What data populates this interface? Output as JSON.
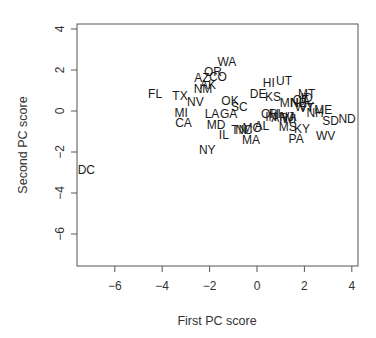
{
  "chart_data": {
    "type": "scatter",
    "title": "",
    "xlabel": "First PC score",
    "ylabel": "Second PC score",
    "xlim": [
      -7.5,
      4.2
    ],
    "ylim": [
      -7.5,
      4.3
    ],
    "x_ticks": [
      -6,
      -4,
      -2,
      0,
      2,
      4
    ],
    "y_ticks": [
      -6,
      -4,
      -2,
      0,
      2,
      4
    ],
    "grid": false,
    "legend": null,
    "marker": "text-label",
    "points": [
      {
        "label": "WA",
        "x": -1.27,
        "y": 2.4
      },
      {
        "label": "OR",
        "x": -1.86,
        "y": 1.9
      },
      {
        "label": "AZ",
        "x": -2.32,
        "y": 1.6
      },
      {
        "label": "CO",
        "x": -1.65,
        "y": 1.65
      },
      {
        "label": "AK",
        "x": -2.07,
        "y": 1.25
      },
      {
        "label": "NM",
        "x": -2.28,
        "y": 1.05
      },
      {
        "label": "FL",
        "x": -4.3,
        "y": 0.85
      },
      {
        "label": "TX",
        "x": -3.25,
        "y": 0.73
      },
      {
        "label": "NV",
        "x": -2.6,
        "y": 0.45
      },
      {
        "label": "MI",
        "x": -3.2,
        "y": -0.1
      },
      {
        "label": "CA",
        "x": -3.1,
        "y": -0.6
      },
      {
        "label": "LA",
        "x": -1.9,
        "y": -0.15
      },
      {
        "label": "GA",
        "x": -1.2,
        "y": -0.15
      },
      {
        "label": "MD",
        "x": -1.73,
        "y": -0.7
      },
      {
        "label": "IL",
        "x": -1.4,
        "y": -1.15
      },
      {
        "label": "NY",
        "x": -2.1,
        "y": -1.9
      },
      {
        "label": "DC",
        "x": -7.2,
        "y": -2.9
      },
      {
        "label": "OK",
        "x": -1.14,
        "y": 0.5
      },
      {
        "label": "SC",
        "x": -0.75,
        "y": 0.2
      },
      {
        "label": "DE",
        "x": 0.05,
        "y": 0.85
      },
      {
        "label": "HI",
        "x": 0.5,
        "y": 1.35
      },
      {
        "label": "UT",
        "x": 1.14,
        "y": 1.45
      },
      {
        "label": "KS",
        "x": 0.68,
        "y": 0.67
      },
      {
        "label": "TN",
        "x": -0.75,
        "y": -0.93
      },
      {
        "label": "NC",
        "x": -0.55,
        "y": -0.93
      },
      {
        "label": "MO",
        "x": -0.2,
        "y": -0.85
      },
      {
        "label": "MA",
        "x": -0.25,
        "y": -1.4
      },
      {
        "label": "AL",
        "x": 0.2,
        "y": -0.72
      },
      {
        "label": "OH",
        "x": 0.55,
        "y": -0.15
      },
      {
        "label": "RI",
        "x": 0.75,
        "y": -0.15
      },
      {
        "label": "IN",
        "x": 0.6,
        "y": -0.3
      },
      {
        "label": "AR",
        "x": 0.95,
        "y": -0.35
      },
      {
        "label": "VA",
        "x": 1.35,
        "y": -0.3
      },
      {
        "label": "WI",
        "x": 1.35,
        "y": -0.4
      },
      {
        "label": "NJ",
        "x": 1.25,
        "y": -0.3
      },
      {
        "label": "MS",
        "x": 1.3,
        "y": -0.8
      },
      {
        "label": "KY",
        "x": 1.9,
        "y": -0.9
      },
      {
        "label": "PA",
        "x": 1.65,
        "y": -1.37
      },
      {
        "label": "MN",
        "x": 1.35,
        "y": 0.4
      },
      {
        "label": "NE",
        "x": 1.75,
        "y": 0.4
      },
      {
        "label": "CT",
        "x": 1.85,
        "y": 0.55
      },
      {
        "label": "IA",
        "x": 2.0,
        "y": 0.5
      },
      {
        "label": "ID",
        "x": 2.1,
        "y": 0.65
      },
      {
        "label": "MT",
        "x": 2.1,
        "y": 0.83
      },
      {
        "label": "WY",
        "x": 2.0,
        "y": 0.2
      },
      {
        "label": "VT",
        "x": 2.1,
        "y": 0.15
      },
      {
        "label": "NH",
        "x": 2.45,
        "y": -0.1
      },
      {
        "label": "ME",
        "x": 2.8,
        "y": 0.05
      },
      {
        "label": "SD",
        "x": 3.1,
        "y": -0.5
      },
      {
        "label": "ND",
        "x": 3.8,
        "y": -0.4
      },
      {
        "label": "WV",
        "x": 2.9,
        "y": -1.2
      }
    ]
  },
  "colors": {
    "background": "#ffffff",
    "axis": "#555555",
    "text": "#1a1a1a"
  }
}
